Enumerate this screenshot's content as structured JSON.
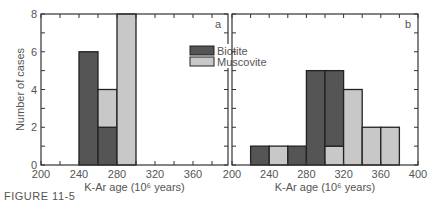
{
  "figure": {
    "caption": "FIGURE 11-5"
  },
  "colors": {
    "biotite": "#555555",
    "muscovite": "#c8c8c8",
    "frame": "#333333"
  },
  "chart_data": [
    {
      "type": "bar",
      "stacked": true,
      "panel_label": "a",
      "title": "",
      "xlabel": "K-Ar age (10⁶ years)",
      "ylabel": "Number of cases",
      "xlim": [
        200,
        405
      ],
      "ylim": [
        0,
        8
      ],
      "xticks": [
        200,
        240,
        280,
        320,
        360
      ],
      "yticks": [
        0,
        2,
        4,
        6,
        8
      ],
      "bins": [
        [
          240,
          260
        ],
        [
          260,
          280
        ],
        [
          280,
          300
        ]
      ],
      "series": [
        {
          "name": "Biotite",
          "values": [
            6,
            2,
            0
          ]
        },
        {
          "name": "Muscovite",
          "values": [
            0,
            2,
            8
          ]
        }
      ],
      "legend": [
        "Biotite",
        "Muscovite"
      ],
      "legend_position": "upper right"
    },
    {
      "type": "bar",
      "stacked": true,
      "panel_label": "b",
      "title": "",
      "xlabel": "K-Ar age (10⁶ years)",
      "ylabel": "",
      "xlim": [
        200,
        400
      ],
      "ylim": [
        0,
        8
      ],
      "xticks": [
        200,
        240,
        280,
        320,
        360,
        400
      ],
      "yticks": [
        0,
        2,
        4,
        6,
        8
      ],
      "bins": [
        [
          220,
          240
        ],
        [
          240,
          260
        ],
        [
          260,
          280
        ],
        [
          280,
          300
        ],
        [
          300,
          320
        ],
        [
          320,
          340
        ],
        [
          340,
          360
        ],
        [
          360,
          380
        ]
      ],
      "series": [
        {
          "name": "Muscovite (lower)",
          "values": [
            0,
            1,
            0,
            0,
            1,
            4,
            2,
            2
          ]
        },
        {
          "name": "Biotite",
          "values": [
            1,
            0,
            1,
            5,
            4,
            0,
            0,
            0
          ]
        }
      ],
      "totals_by_mineral": {
        "Biotite": [
          1,
          0,
          1,
          5,
          4,
          0,
          0,
          0
        ],
        "Muscovite": [
          0,
          1,
          0,
          0,
          1,
          4,
          2,
          2
        ]
      }
    }
  ]
}
